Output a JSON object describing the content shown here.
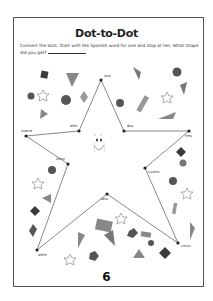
{
  "worksheet": {
    "title": "Dot-to-Dot",
    "instructions": "Connect the dots. Start with the Spanish word for one and stop at ten. What shape did you get?",
    "answer_blank": "",
    "page_number": "6"
  },
  "dots": [
    {
      "label": "uno",
      "number": 1,
      "x": 101,
      "y": 80
    },
    {
      "label": "dos",
      "number": 2,
      "x": 124,
      "y": 131
    },
    {
      "label": "tres",
      "number": 3,
      "x": 189,
      "y": 131
    },
    {
      "label": "cuatro",
      "number": 4,
      "x": 145,
      "y": 168
    },
    {
      "label": "cinco",
      "number": 5,
      "x": 178,
      "y": 243
    },
    {
      "label": "seis",
      "number": 6,
      "x": 107,
      "y": 194
    },
    {
      "label": "siete",
      "number": 7,
      "x": 37,
      "y": 250
    },
    {
      "label": "ocho",
      "number": 8,
      "x": 68,
      "y": 164
    },
    {
      "label": "nueve",
      "number": 9,
      "x": 26,
      "y": 136
    },
    {
      "label": "diez",
      "number": 10,
      "x": 79,
      "y": 131
    }
  ],
  "colors": {
    "line": "#7a7a7a",
    "dot": "#222222",
    "shape_dark": "#3a3a3a",
    "shape_mid": "#777777",
    "shape_light": "#9a9a9a"
  }
}
